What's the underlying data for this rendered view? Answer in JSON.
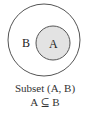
{
  "diagram": {
    "type": "venn-subset",
    "outer_set": {
      "label": "B",
      "fill": "#ffffff",
      "stroke": "#555555"
    },
    "inner_set": {
      "label": "A",
      "fill": "#e3e3e3",
      "stroke": "#555555"
    },
    "caption": {
      "title": "Subset (A, B)",
      "relation": "A ⊆ B"
    }
  }
}
